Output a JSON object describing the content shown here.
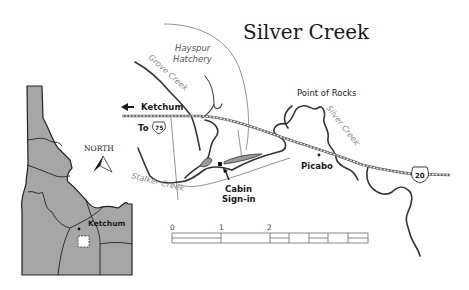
{
  "map": {
    "title": "Silver Creek",
    "labels": {
      "hatchery_line1": "Hayspur",
      "hatchery_line2": "Hatchery",
      "grove_creek": "Grove Creek",
      "stalker_creek": "Stalker Creek",
      "silver_creek": "Silver Creek",
      "point_of_rocks": "Point of Rocks",
      "picabo": "Picabo",
      "ketchum_direction": "Ketchum",
      "to_label": "To",
      "cabin_line1": "Cabin",
      "cabin_line2": "Sign-in"
    },
    "highways": {
      "us75": "75",
      "us20": "20"
    },
    "icons": {
      "left_arrow": "arrow-left-icon",
      "cabin_arrow": "arrow-up-left-icon",
      "north_arrow": "north-arrow-icon",
      "cabin_marker": "square-marker-icon",
      "town_marker": "dot-marker-icon"
    },
    "colors": {
      "state_fill": "#a6a6a6",
      "river": "#333333",
      "creek_label": "#8a8a8a",
      "road": "#666666"
    }
  },
  "inset": {
    "north_label": "NORTH",
    "ketchum_label": "Ketchum"
  },
  "scale_bar": {
    "ticks": [
      "0",
      "1",
      "2",
      "4"
    ],
    "unit_note": ""
  }
}
